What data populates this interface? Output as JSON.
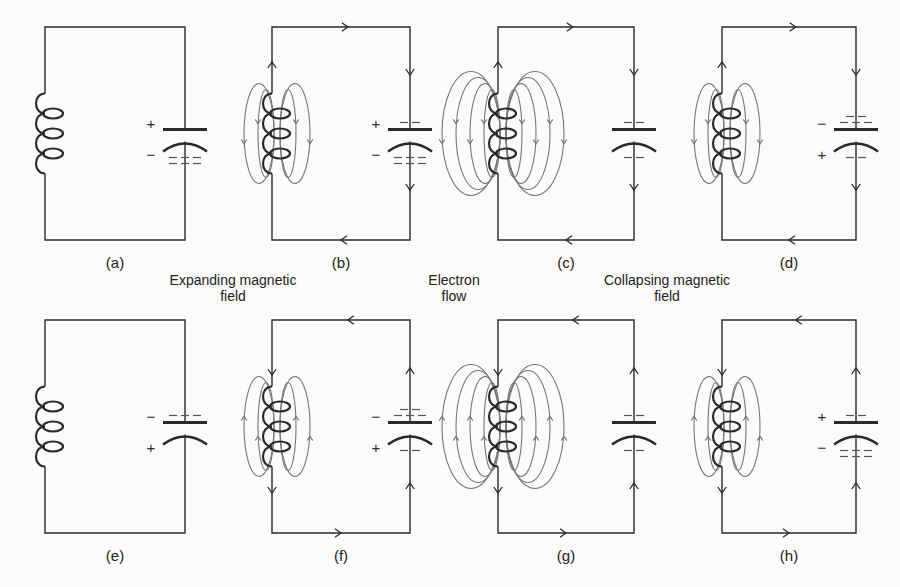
{
  "figure": {
    "stroke_color": "#2a2a2a",
    "field_color": "#777777",
    "background": "#fbfbf9"
  },
  "captions": {
    "expanding": {
      "line1": "Expanding magnetic",
      "line2": "field"
    },
    "electron": {
      "line1": "Electron",
      "line2": "flow"
    },
    "collapsing": {
      "line1": "Collapsing magnetic",
      "line2": "field"
    }
  },
  "panels": [
    {
      "id": "a",
      "label": "(a)",
      "x": 45,
      "y": 27,
      "w": 140,
      "h": 213,
      "field": 0,
      "cap_top_sign": "+",
      "cap_bottom_sign": "−",
      "charge_top": "",
      "charge_bottom": "many",
      "flow": "none"
    },
    {
      "id": "b",
      "label": "(b)",
      "x": 272,
      "y": 27,
      "w": 138,
      "h": 213,
      "field": 2,
      "cap_top_sign": "+",
      "cap_bottom_sign": "−",
      "charge_top": "few",
      "charge_bottom": "some",
      "flow": "cw"
    },
    {
      "id": "c",
      "label": "(c)",
      "x": 498,
      "y": 27,
      "w": 136,
      "h": 213,
      "field": 4,
      "cap_top_sign": "",
      "cap_bottom_sign": "",
      "charge_top": "few",
      "charge_bottom": "few",
      "flow": "cw"
    },
    {
      "id": "d",
      "label": "(d)",
      "x": 722,
      "y": 27,
      "w": 134,
      "h": 213,
      "field": 2,
      "cap_top_sign": "−",
      "cap_bottom_sign": "+",
      "charge_top": "some",
      "charge_bottom": "few",
      "flow": "cw"
    },
    {
      "id": "e",
      "label": "(e)",
      "x": 45,
      "y": 320,
      "w": 140,
      "h": 213,
      "field": 0,
      "cap_top_sign": "−",
      "cap_bottom_sign": "+",
      "charge_top": "many",
      "charge_bottom": "",
      "flow": "none"
    },
    {
      "id": "f",
      "label": "(f)",
      "x": 272,
      "y": 320,
      "w": 138,
      "h": 213,
      "field": 2,
      "cap_top_sign": "−",
      "cap_bottom_sign": "+",
      "charge_top": "some",
      "charge_bottom": "few",
      "flow": "ccw"
    },
    {
      "id": "g",
      "label": "(g)",
      "x": 498,
      "y": 320,
      "w": 136,
      "h": 213,
      "field": 4,
      "cap_top_sign": "",
      "cap_bottom_sign": "",
      "charge_top": "few",
      "charge_bottom": "few",
      "flow": "ccw"
    },
    {
      "id": "h",
      "label": "(h)",
      "x": 722,
      "y": 320,
      "w": 134,
      "h": 213,
      "field": 2,
      "cap_top_sign": "+",
      "cap_bottom_sign": "−",
      "charge_top": "few",
      "charge_bottom": "some",
      "flow": "ccw"
    }
  ]
}
